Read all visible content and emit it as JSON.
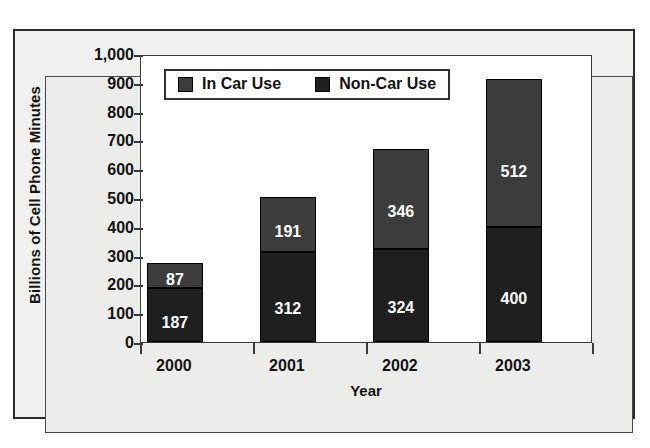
{
  "figure": {
    "background_color": "#ffffff",
    "panel_color": "#ececeb",
    "plot_background": "#ffffff",
    "border_color": "#2b2b2b"
  },
  "chart_data": {
    "type": "bar",
    "subtype": "stacked-column",
    "title": "",
    "xlabel": "Year",
    "ylabel": "Billions of Cell Phone Minutes",
    "categories": [
      "2000",
      "2001",
      "2002",
      "2003"
    ],
    "series": [
      {
        "name": "Non-Car Use",
        "color": "#1f1f1f",
        "values": [
          187,
          312,
          324,
          400
        ],
        "labels": [
          "187",
          "312",
          "324",
          "400"
        ],
        "stack_order": 0
      },
      {
        "name": "In Car Use",
        "color": "#3c3c3c",
        "values": [
          87,
          191,
          346,
          512
        ],
        "labels": [
          "87",
          "191",
          "346",
          "512"
        ],
        "stack_order": 1
      }
    ],
    "totals": [
      274,
      503,
      670,
      912
    ],
    "ylim": [
      0,
      1000
    ],
    "ytick_step": 100,
    "ytick_labels": [
      "1,000",
      "900",
      "800",
      "700",
      "600",
      "500",
      "400",
      "300",
      "200",
      "100",
      "0"
    ],
    "ytick_values": [
      1000,
      900,
      800,
      700,
      600,
      500,
      400,
      300,
      200,
      100,
      0
    ],
    "grid": false,
    "legend_position": "upper-left-inside",
    "legend_entries": [
      "In Car Use",
      "Non-Car Use"
    ],
    "data_labels_visible": true,
    "data_label_color": "#ffffff"
  },
  "legend": {
    "items": [
      {
        "label": "In Car Use",
        "color": "#3c3c3c"
      },
      {
        "label": "Non-Car Use",
        "color": "#1f1f1f"
      }
    ]
  },
  "axes": {
    "y_title": "Billions of Cell Phone Minutes",
    "x_title": "Year",
    "y_ticks": [
      "1,000",
      "900",
      "800",
      "700",
      "600",
      "500",
      "400",
      "300",
      "200",
      "100",
      "0"
    ],
    "x_ticks": [
      "2000",
      "2001",
      "2002",
      "2003"
    ]
  },
  "bars": [
    {
      "category": "2000",
      "segments": [
        {
          "series": "In Car Use",
          "value": 87,
          "label": "87",
          "color": "#3c3c3c"
        },
        {
          "series": "Non-Car Use",
          "value": 187,
          "label": "187",
          "color": "#1f1f1f"
        }
      ]
    },
    {
      "category": "2001",
      "segments": [
        {
          "series": "In Car Use",
          "value": 191,
          "label": "191",
          "color": "#3c3c3c"
        },
        {
          "series": "Non-Car Use",
          "value": 312,
          "label": "312",
          "color": "#1f1f1f"
        }
      ]
    },
    {
      "category": "2002",
      "segments": [
        {
          "series": "In Car Use",
          "value": 346,
          "label": "346",
          "color": "#3c3c3c"
        },
        {
          "series": "Non-Car Use",
          "value": 324,
          "label": "324",
          "color": "#1f1f1f"
        }
      ]
    },
    {
      "category": "2003",
      "segments": [
        {
          "series": "In Car Use",
          "value": 512,
          "label": "512",
          "color": "#3c3c3c"
        },
        {
          "series": "Non-Car Use",
          "value": 400,
          "label": "400",
          "color": "#1f1f1f"
        }
      ]
    }
  ]
}
